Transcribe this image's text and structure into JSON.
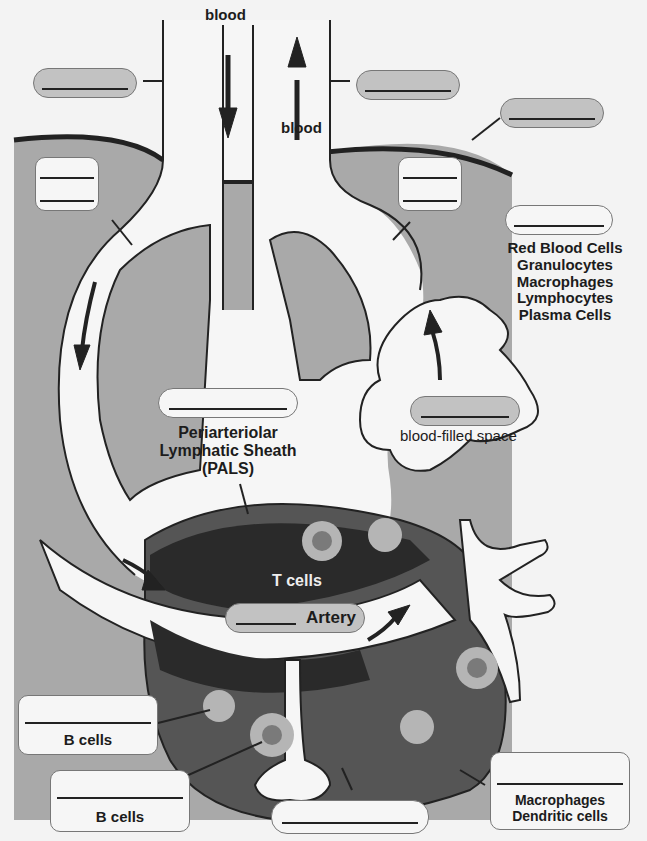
{
  "diagram": {
    "flow_labels": {
      "in": "blood",
      "out": "blood"
    },
    "red_pulp_cells": [
      "Red Blood Cells",
      "Granulocytes",
      "Macrophages",
      "Lymphocytes",
      "Plasma Cells"
    ],
    "pals_label": [
      "Periarteriolar",
      "Lymphatic Sheath",
      "(PALS)"
    ],
    "t_cells_label": "T cells",
    "artery_label": "Artery",
    "blood_space_label": "blood-filled space",
    "b_cells_label_1": "B cells",
    "b_cells_label_2": "B cells",
    "marginal_labels": [
      "Macrophages",
      "Dendritic cells"
    ],
    "blank_boxes": [
      "vein-label-left",
      "vein-label-right",
      "capsule-label",
      "trabecular-artery-label",
      "trabecular-vein-label",
      "red-pulp-label",
      "pals-label",
      "sinusoid-label",
      "central-artery-label",
      "germinal-center-label",
      "follicle-label",
      "marginal-sinus-label",
      "marginal-zone-label"
    ],
    "colors": {
      "background": "#f3f3f3",
      "red_pulp": "#a9a9a9",
      "white_pulp": "#555555",
      "pals_dark": "#2a2a2a",
      "vessel": "#f6f6f6",
      "cell_light": "#b5b5b5",
      "cell_core": "#7a7a7a"
    }
  }
}
